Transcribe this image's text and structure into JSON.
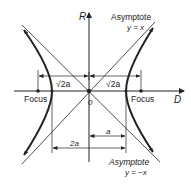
{
  "diagram": {
    "type": "rectangular hyperbola",
    "axes": {
      "vertical_label": "R",
      "horizontal_label": "D",
      "origin_label": "0"
    },
    "asymptotes": [
      {
        "title": "Asymptote",
        "equation": "y = x"
      },
      {
        "title": "Asymptote",
        "equation": "y = −x"
      }
    ],
    "foci": [
      {
        "label": "Focus",
        "side": "left"
      },
      {
        "label": "Focus",
        "side": "right"
      }
    ],
    "dimensions": {
      "focal_left": "√2a",
      "focal_right": "√2a",
      "semi_axis": "a",
      "full_axis": "2a"
    },
    "colors": {
      "line": "#222222",
      "background": "#ffffff"
    }
  }
}
